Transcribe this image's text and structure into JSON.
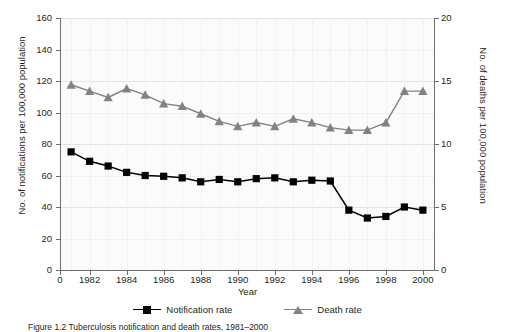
{
  "chart_data": {
    "type": "line",
    "title": "",
    "xlabel": "Year",
    "ylabel": "No. of notifications per 100,000 population",
    "y2label": "No. of deaths per 100,000 population",
    "x": [
      1981,
      1982,
      1983,
      1984,
      1985,
      1986,
      1987,
      1988,
      1989,
      1990,
      1991,
      1992,
      1993,
      1994,
      1995,
      1996,
      1997,
      1998,
      1999,
      2000
    ],
    "xlim": [
      1980.4,
      2000.6
    ],
    "ylim": [
      0,
      160
    ],
    "y2lim": [
      0,
      20
    ],
    "grid": true,
    "legend_position": "bottom",
    "xtick_labels": [
      "0",
      "1982",
      "1984",
      "1986",
      "1988",
      "1990",
      "1992",
      "1994",
      "1996",
      "1998",
      "2000"
    ],
    "xtick_values": [
      1980.4,
      1982,
      1984,
      1986,
      1988,
      1990,
      1992,
      1994,
      1996,
      1998,
      2000
    ],
    "ytick_labels": [
      "0",
      "20",
      "40",
      "60",
      "80",
      "100",
      "120",
      "140",
      "160"
    ],
    "ytick_values": [
      0,
      20,
      40,
      60,
      80,
      100,
      120,
      140,
      160
    ],
    "y2tick_labels": [
      "0",
      "5",
      "10",
      "15",
      "20"
    ],
    "y2tick_values": [
      0,
      5,
      10,
      15,
      20
    ],
    "series": [
      {
        "name": "Notification rate",
        "axis": "left",
        "marker": "square",
        "color": "#000000",
        "values": [
          75,
          69,
          66,
          62,
          60,
          59.5,
          58.5,
          56,
          57.5,
          56,
          58,
          58.5,
          56,
          57,
          56.5,
          38,
          33,
          34,
          40,
          38
        ]
      },
      {
        "name": "Death rate",
        "axis": "right",
        "marker": "triangle",
        "color": "#808285",
        "values": [
          14.7,
          14.2,
          13.7,
          14.4,
          13.9,
          13.2,
          13.0,
          12.4,
          11.8,
          11.4,
          11.7,
          11.4,
          12.0,
          11.7,
          11.3,
          11.1,
          11.1,
          11.7,
          14.2,
          14.2
        ]
      }
    ],
    "legend": [
      "Notification rate",
      "Death rate"
    ]
  },
  "caption": {
    "text": "Figure 1.2   Tuberculosis notification and death rates, 1981–2000"
  },
  "colors": {
    "notification": "#000000",
    "death": "#808285",
    "axis": "#6d6e71",
    "grid": "#e2e3e4",
    "plot_background": "#fbfbfb"
  }
}
